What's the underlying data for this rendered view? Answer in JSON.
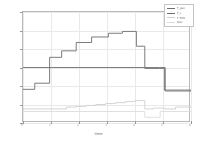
{
  "chart_data": {
    "type": "line",
    "title": "",
    "subtitle": "",
    "xlabel": "time",
    "ylabel": "Generated Power (MW)",
    "xlim": [
      0,
      6
    ],
    "ylim": [
      0,
      60
    ],
    "xticks": [
      "0",
      "1",
      "2",
      "3",
      "4",
      "5",
      "6"
    ],
    "yticks": [
      "0",
      "10",
      "20",
      "30",
      "40",
      "50",
      "60"
    ],
    "grid": true,
    "legend_position": "upper right",
    "series": [
      {
        "name": "P_gen",
        "color": "#6e6e6e",
        "style": "step",
        "x": [
          0.0,
          0.42,
          0.42,
          0.95,
          0.95,
          1.38,
          1.38,
          1.9,
          1.9,
          2.45,
          2.45,
          3.05,
          3.05,
          3.55,
          3.55,
          4.05,
          4.05,
          4.35,
          4.35,
          4.9,
          4.9,
          5.05,
          5.05,
          6.0
        ],
        "y": [
          18.2,
          18.2,
          21.5,
          21.5,
          35.5,
          35.5,
          39.0,
          39.0,
          43.5,
          43.5,
          46.5,
          46.5,
          48.5,
          48.5,
          49.5,
          49.5,
          41.5,
          41.5,
          29.5,
          29.5,
          29.5,
          29.5,
          17.8,
          17.8
        ]
      },
      {
        "name": "P_L",
        "color": "#707070",
        "style": "step",
        "x": [
          0.0,
          4.88,
          4.88,
          5.08,
          5.08,
          6.0
        ],
        "y": [
          30.0,
          30.0,
          30.0,
          30.0,
          17.3,
          17.3
        ]
      },
      {
        "name": "P_ESS",
        "color": "#cfcfcf",
        "style": "step",
        "x": [
          0.0,
          1.55,
          1.55,
          1.9,
          1.9,
          2.25,
          2.25,
          2.6,
          2.6,
          2.95,
          2.95,
          3.3,
          3.3,
          3.65,
          3.65,
          4.0,
          4.0,
          4.35,
          4.35,
          4.65,
          4.65,
          5.05,
          5.05,
          5.45,
          5.45,
          6.0
        ],
        "y": [
          7.6,
          7.6,
          8.6,
          8.6,
          9.0,
          9.0,
          9.5,
          9.5,
          10.0,
          10.0,
          10.5,
          10.5,
          11.0,
          11.0,
          11.6,
          11.6,
          12.1,
          12.1,
          7.6,
          7.6,
          8.1,
          8.1,
          7.6,
          7.6,
          8.6,
          8.6
        ]
      },
      {
        "name": "SOC",
        "color": "#dcdcdc",
        "style": "step",
        "x": [
          0.0,
          4.35,
          4.35,
          4.9,
          4.9,
          6.0
        ],
        "y": [
          6.2,
          6.2,
          3.1,
          3.1,
          6.2,
          6.2
        ]
      }
    ]
  },
  "legend": {
    "items": [
      {
        "label": "P_gen",
        "color": "#6e6e6e"
      },
      {
        "label": "P_L",
        "color": "#707070"
      },
      {
        "label": "P_ESS",
        "color": "#cfcfcf"
      },
      {
        "label": "SOC",
        "color": "#dcdcdc"
      }
    ]
  },
  "axes": {
    "x_title": "time",
    "y_title": "Generated Power (MW)"
  }
}
